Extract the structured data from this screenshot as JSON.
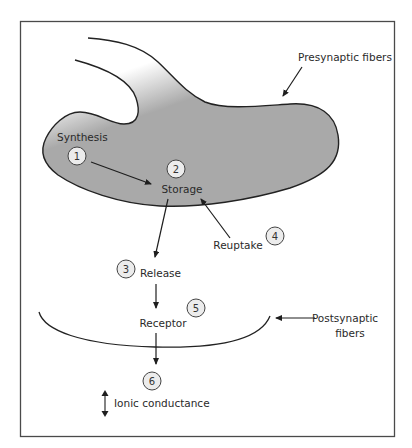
{
  "colors": {
    "presynaptic_fill": "#a9a9a9",
    "outline": "#222222",
    "step_circle_fill": "#ececec"
  },
  "structures": {
    "presynaptic": "Presynaptic fibers",
    "postsynaptic_line1": "Postsynaptic",
    "postsynaptic_line2": "fibers"
  },
  "steps": [
    {
      "number": "1",
      "label": "Synthesis"
    },
    {
      "number": "2",
      "label": "Storage"
    },
    {
      "number": "3",
      "label": "Release"
    },
    {
      "number": "4",
      "label": "Reuptake"
    },
    {
      "number": "5",
      "label": "Receptor"
    },
    {
      "number": "6",
      "label": "Ionic conductance"
    }
  ]
}
